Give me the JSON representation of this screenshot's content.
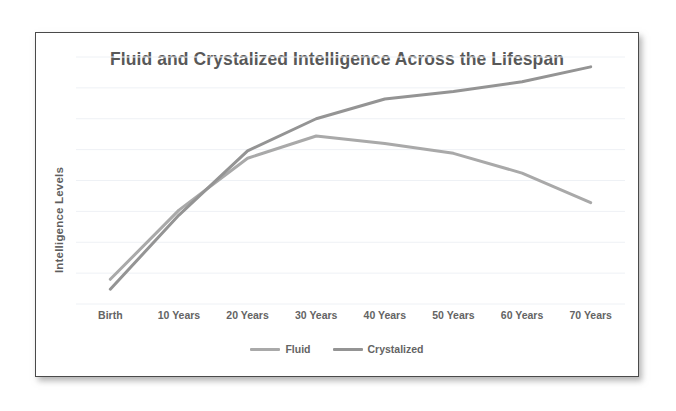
{
  "chart_data": {
    "type": "line",
    "title": "Fluid and Crystalized Intelligence Across the Lifespan",
    "xlabel": "",
    "ylabel": "Intelligence Levels",
    "categories": [
      "Birth",
      "10 Years",
      "20 Years",
      "30 Years",
      "40 Years",
      "50 Years",
      "60 Years",
      "70 Years"
    ],
    "ylim": [
      0,
      100
    ],
    "yticks_labeled": false,
    "gridlines": 9,
    "grid": true,
    "legend_position": "bottom",
    "series": [
      {
        "name": "Fluid",
        "color": "#a9a9a9",
        "values": [
          10,
          38,
          59,
          68,
          65,
          61,
          53,
          41
        ]
      },
      {
        "name": "Crystalized",
        "color": "#949494",
        "values": [
          6,
          36,
          62,
          75,
          83,
          86,
          90,
          96
        ]
      }
    ]
  },
  "legend": {
    "entries": [
      {
        "label": "Fluid",
        "color": "#a9a9a9"
      },
      {
        "label": "Crystalized",
        "color": "#949494"
      }
    ]
  },
  "style": {
    "grid_color": "#eef1f5",
    "title_color": "#585858",
    "axis_label_color": "#646464",
    "frame_color": "#4a4a4a",
    "background": "#ffffff"
  }
}
